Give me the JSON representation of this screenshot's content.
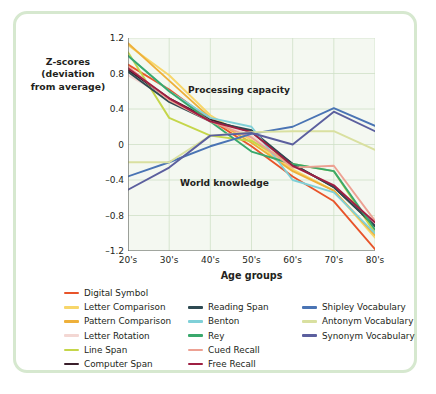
{
  "figure": {
    "y_axis_title": "Z-scores (deviation from average)",
    "x_axis_title": "Age groups",
    "annotation_upper": "Processing capacity",
    "annotation_lower": "World knowledge",
    "frame_color": "#d6e8cf",
    "plot_background": "#f4f8f1",
    "grid_color": "#cfe0c8"
  },
  "chart_data": {
    "type": "line",
    "title": "",
    "xlabel": "Age groups",
    "ylabel": "Z-scores (deviation from average)",
    "categories": [
      "20's",
      "30's",
      "40's",
      "50's",
      "60's",
      "70's",
      "80's"
    ],
    "x_tick_labels": [
      "20's",
      "30's",
      "40's",
      "50's",
      "60's",
      "70's",
      "80's"
    ],
    "y_tick_labels": [
      "1.2",
      "0.8",
      "0.4",
      "0",
      "-0.4",
      "-0.8",
      "-1.2"
    ],
    "y_ticks": [
      1.2,
      0.8,
      0.4,
      0,
      -0.4,
      -0.8,
      -1.2
    ],
    "ylim": [
      -1.2,
      1.2
    ],
    "grid": true,
    "legend_position": "below",
    "annotations": [
      {
        "text": "Processing capacity",
        "x": "45's",
        "y": 0.62
      },
      {
        "text": "World knowledge",
        "x": "37's",
        "y": -0.42
      }
    ],
    "series": [
      {
        "name": "Digital Symbol",
        "color": "#e8542a",
        "values": [
          0.9,
          0.62,
          0.28,
          -0.02,
          -0.36,
          -0.64,
          -1.18
        ]
      },
      {
        "name": "Letter Comparison",
        "color": "#f7d66a",
        "values": [
          1.12,
          0.78,
          0.33,
          0.05,
          -0.28,
          -0.52,
          -1.05
        ]
      },
      {
        "name": "Pattern Comparison",
        "color": "#eeb03a",
        "values": [
          1.14,
          0.72,
          0.3,
          0.02,
          -0.3,
          -0.52,
          -1.02
        ]
      },
      {
        "name": "Letter Rotation",
        "color": "#f3d7d3",
        "values": [
          0.78,
          0.52,
          0.28,
          0.1,
          -0.24,
          -0.46,
          -0.88
        ]
      },
      {
        "name": "Line Span",
        "color": "#c5d64a",
        "values": [
          1.04,
          0.3,
          0.1,
          0.04,
          -0.22,
          -0.3,
          -1.0
        ]
      },
      {
        "name": "Computer Span",
        "color": "#3a1f2b",
        "values": [
          0.84,
          0.52,
          0.28,
          0.14,
          -0.22,
          -0.48,
          -0.92
        ]
      },
      {
        "name": "Reading Span",
        "color": "#2e4a52",
        "values": [
          0.82,
          0.48,
          0.26,
          0.16,
          -0.22,
          -0.48,
          -0.92
        ]
      },
      {
        "name": "Benton",
        "color": "#7fd0d8",
        "values": [
          1.0,
          0.6,
          0.3,
          0.2,
          -0.4,
          -0.54,
          -1.0
        ]
      },
      {
        "name": "Rey",
        "color": "#39a86c",
        "values": [
          1.0,
          0.6,
          0.26,
          -0.08,
          -0.22,
          -0.3,
          -0.96
        ]
      },
      {
        "name": "Cued Recall",
        "color": "#eda193",
        "values": [
          0.88,
          0.5,
          0.26,
          0.08,
          -0.26,
          -0.24,
          -0.86
        ]
      },
      {
        "name": "Free Recall",
        "color": "#9e1f42",
        "values": [
          0.86,
          0.52,
          0.26,
          0.14,
          -0.24,
          -0.46,
          -0.88
        ]
      },
      {
        "name": "Shipley Vocabulary",
        "color": "#4a74b4",
        "values": [
          -0.36,
          -0.2,
          -0.02,
          0.12,
          0.2,
          0.41,
          0.21
        ]
      },
      {
        "name": "Antonym Vocabulary",
        "color": "#d9e0a0",
        "values": [
          -0.2,
          -0.2,
          0.1,
          0.14,
          0.15,
          0.15,
          -0.06
        ]
      },
      {
        "name": "Synonym Vocabulary",
        "color": "#5b5f9e",
        "values": [
          -0.51,
          -0.26,
          0.1,
          0.13,
          0.0,
          0.37,
          0.15
        ]
      }
    ]
  },
  "legend": {
    "columns": [
      {
        "items": [
          {
            "label": "Digital Symbol",
            "color": "#e8542a"
          },
          {
            "label": "Letter Comparison",
            "color": "#f7d66a"
          },
          {
            "label": "Pattern Comparison",
            "color": "#eeb03a"
          },
          {
            "label": "Letter Rotation",
            "color": "#f3d7d3"
          },
          {
            "label": "Line Span",
            "color": "#c5d64a"
          },
          {
            "label": "Computer Span",
            "color": "#3a1f2b"
          }
        ]
      },
      {
        "items": [
          {
            "label": "Reading Span",
            "color": "#2e4a52"
          },
          {
            "label": "Benton",
            "color": "#7fd0d8"
          },
          {
            "label": "Rey",
            "color": "#39a86c"
          },
          {
            "label": "Cued Recall",
            "color": "#eda193"
          },
          {
            "label": "Free Recall",
            "color": "#9e1f42"
          }
        ]
      },
      {
        "items": [
          {
            "label": "Shipley Vocabulary",
            "color": "#4a74b4"
          },
          {
            "label": "Antonym Vocabulary",
            "color": "#d9e0a0"
          },
          {
            "label": "Synonym Vocabulary",
            "color": "#5b5f9e"
          }
        ]
      }
    ]
  }
}
